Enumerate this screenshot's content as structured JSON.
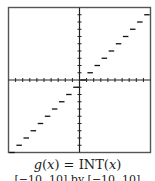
{
  "figure": {
    "caption": {
      "func_name": "g",
      "var": "x",
      "equals": " = ",
      "rhs_func": "INT",
      "open_paren": "(",
      "close_paren": ")"
    },
    "window_label": "[−10, 10] by [−10, 10]"
  },
  "chart_data": {
    "type": "line",
    "title": "g(x) = INT(x)",
    "subtitle": "[−10, 10] by [−10, 10]",
    "xlabel": "",
    "ylabel": "",
    "xlim": [
      -10,
      10
    ],
    "ylim": [
      -10,
      10
    ],
    "xscale_ticks": 1,
    "yscale_ticks": 1,
    "grid": false,
    "legend": null,
    "style": "step function (greatest integer), horizontal segments on [n, n+1)",
    "series": [
      {
        "name": "g(x) = INT(x)",
        "segments": [
          {
            "x_start": -10,
            "x_end": -9,
            "y": -10
          },
          {
            "x_start": -9,
            "x_end": -8,
            "y": -9
          },
          {
            "x_start": -8,
            "x_end": -7,
            "y": -8
          },
          {
            "x_start": -7,
            "x_end": -6,
            "y": -7
          },
          {
            "x_start": -6,
            "x_end": -5,
            "y": -6
          },
          {
            "x_start": -5,
            "x_end": -4,
            "y": -5
          },
          {
            "x_start": -4,
            "x_end": -3,
            "y": -4
          },
          {
            "x_start": -3,
            "x_end": -2,
            "y": -3
          },
          {
            "x_start": -2,
            "x_end": -1,
            "y": -2
          },
          {
            "x_start": -1,
            "x_end": 0,
            "y": -1
          },
          {
            "x_start": 0,
            "x_end": 1,
            "y": 0
          },
          {
            "x_start": 1,
            "x_end": 2,
            "y": 1
          },
          {
            "x_start": 2,
            "x_end": 3,
            "y": 2
          },
          {
            "x_start": 3,
            "x_end": 4,
            "y": 3
          },
          {
            "x_start": 4,
            "x_end": 5,
            "y": 4
          },
          {
            "x_start": 5,
            "x_end": 6,
            "y": 5
          },
          {
            "x_start": 6,
            "x_end": 7,
            "y": 6
          },
          {
            "x_start": 7,
            "x_end": 8,
            "y": 7
          },
          {
            "x_start": 8,
            "x_end": 9,
            "y": 8
          },
          {
            "x_start": 9,
            "x_end": 10,
            "y": 9
          }
        ]
      }
    ],
    "colors": {
      "frame": "#555555",
      "axis": "#222222",
      "curve": "#111111",
      "background": "#ffffff"
    }
  }
}
